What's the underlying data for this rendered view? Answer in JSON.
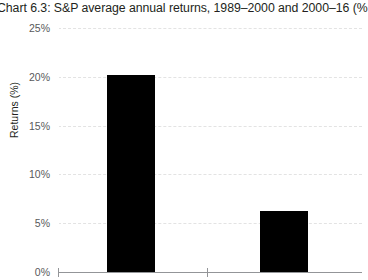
{
  "title": "Chart 6.3: S&P average annual returns, 1989–2000 and 2000–16 (%",
  "axis": {
    "y_title": "Returns (%)"
  },
  "colors": {
    "bar": "#000000",
    "gridline": "#e3e3e3",
    "axis": "#939598",
    "tick_text": "#58595b",
    "title_text": "#231f20",
    "background": "#ffffff"
  },
  "chart_data": {
    "type": "bar",
    "title": "Chart 6.3: S&P average annual returns, 1989–2000 and 2000–16 (%",
    "xlabel": "",
    "ylabel": "Returns (%)",
    "categories": [
      "1989–2000",
      "2000–16"
    ],
    "values": [
      20.2,
      6.2
    ],
    "ylim": [
      0,
      25
    ],
    "ytick_values": [
      0,
      5,
      10,
      15,
      20,
      25
    ],
    "ytick_labels": [
      "0%",
      "5%",
      "10%",
      "15%",
      "20%",
      "25%"
    ],
    "grid": true,
    "legend": false
  }
}
